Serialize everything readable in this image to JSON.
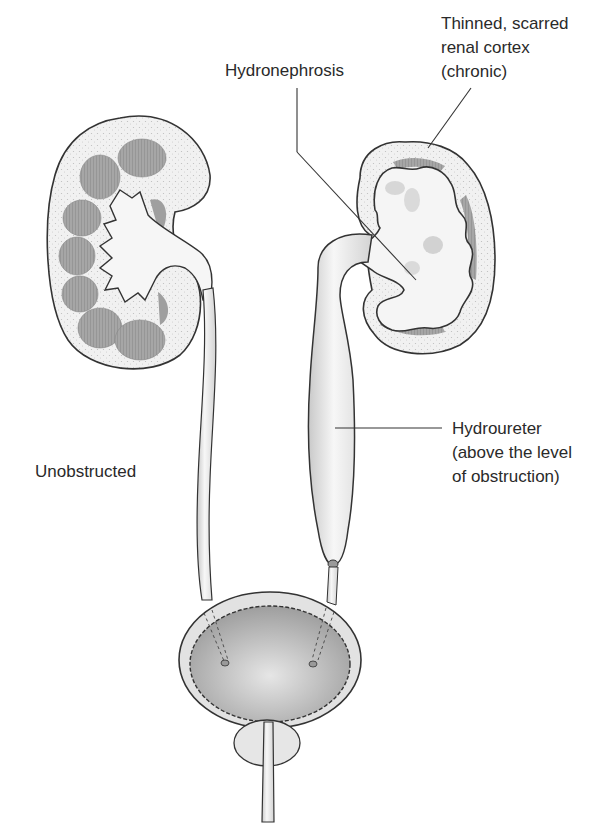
{
  "figure": {
    "labels": {
      "hydronephrosis": "Hydronephrosis",
      "cortex_line1": "Thinned, scarred",
      "cortex_line2": "renal cortex",
      "cortex_line3": "(chronic)",
      "unobstructed": "Unobstructed",
      "hydroureter_line1": "Hydroureter",
      "hydroureter_line2": "(above the level",
      "hydroureter_line3": "of obstruction)"
    },
    "structures": [
      "normal-kidney",
      "normal-ureter",
      "hydronephrotic-kidney",
      "dilated-ureter",
      "obstruction-point",
      "bladder",
      "prostate",
      "urethra"
    ],
    "colors": {
      "outline": "#333333",
      "cortex": "#ececec",
      "pyramid": "#9a9a9a",
      "pelvis": "#f4f4f4",
      "bladder_lumen": "#b8b8b8",
      "leader": "#333333"
    }
  }
}
